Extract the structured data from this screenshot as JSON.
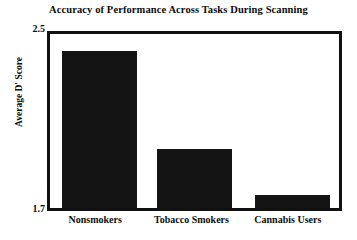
{
  "chart_data": {
    "type": "bar",
    "title": "Accuracy of Performance Across Tasks During Scanning",
    "xlabel": "",
    "ylabel": "Average D' Score",
    "categories": [
      "Nonsmokers",
      "Tobacco Smokers",
      "Cannabis Users"
    ],
    "values": [
      2.42,
      1.97,
      1.76
    ],
    "ylim": [
      1.7,
      2.5
    ],
    "ytick_labels": [
      "1.7",
      "2.5"
    ],
    "yticks": [
      1.7,
      2.5
    ],
    "grid": false,
    "legend": null,
    "bar_color": "#141414",
    "frame_color": "#111111",
    "background_color": "#ffffff",
    "series": [
      {
        "name": "Average D' Score",
        "values": [
          2.42,
          1.97,
          1.76
        ]
      }
    ]
  },
  "axis": {
    "y_top_label": "2.5",
    "y_bottom_label": "1.7"
  }
}
